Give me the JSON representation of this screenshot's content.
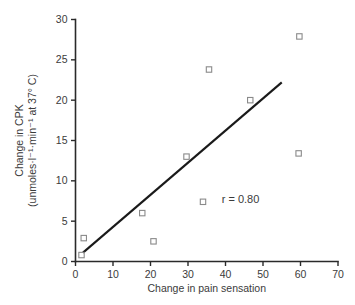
{
  "chart_data": {
    "type": "scatter",
    "title": "",
    "xlabel": "Change in pain sensation",
    "ylabel_line1": "Change in CPK",
    "ylabel_line2": "(unmoles·l⁻¹·min⁻¹ at 37° C)",
    "xlim": [
      0,
      70
    ],
    "ylim": [
      0,
      30
    ],
    "xticks": [
      0,
      10,
      20,
      30,
      40,
      50,
      60,
      70
    ],
    "yticks": [
      0,
      5,
      10,
      15,
      20,
      25,
      30
    ],
    "xtick_labels": [
      "0",
      "10",
      "20",
      "30",
      "40",
      "50",
      "60",
      "70"
    ],
    "ytick_labels": [
      "0",
      "5",
      "10",
      "15",
      "20",
      "25",
      "30"
    ],
    "grid": false,
    "legend": false,
    "marker": "open-square",
    "points": [
      {
        "x": 1.6,
        "y": 0.8
      },
      {
        "x": 2.2,
        "y": 2.9
      },
      {
        "x": 17.8,
        "y": 6.0
      },
      {
        "x": 20.8,
        "y": 2.5
      },
      {
        "x": 29.6,
        "y": 13.0
      },
      {
        "x": 34.0,
        "y": 7.4
      },
      {
        "x": 35.6,
        "y": 23.8
      },
      {
        "x": 46.6,
        "y": 20.0
      },
      {
        "x": 59.5,
        "y": 13.4
      },
      {
        "x": 59.7,
        "y": 27.9
      }
    ],
    "fit_line": {
      "x_start": 2.0,
      "y_start": 1.1,
      "x_end": 55.0,
      "y_end": 22.2
    },
    "annotations": [
      {
        "text": "r = 0.80",
        "x": 44.0,
        "y": 7.2
      }
    ]
  },
  "colors": {
    "axis": "#2a2a2a",
    "marker_stroke": "#8a8a8a",
    "fit_line": "#1a1a1a",
    "text": "#3b3b3b",
    "background": "#ffffff"
  }
}
